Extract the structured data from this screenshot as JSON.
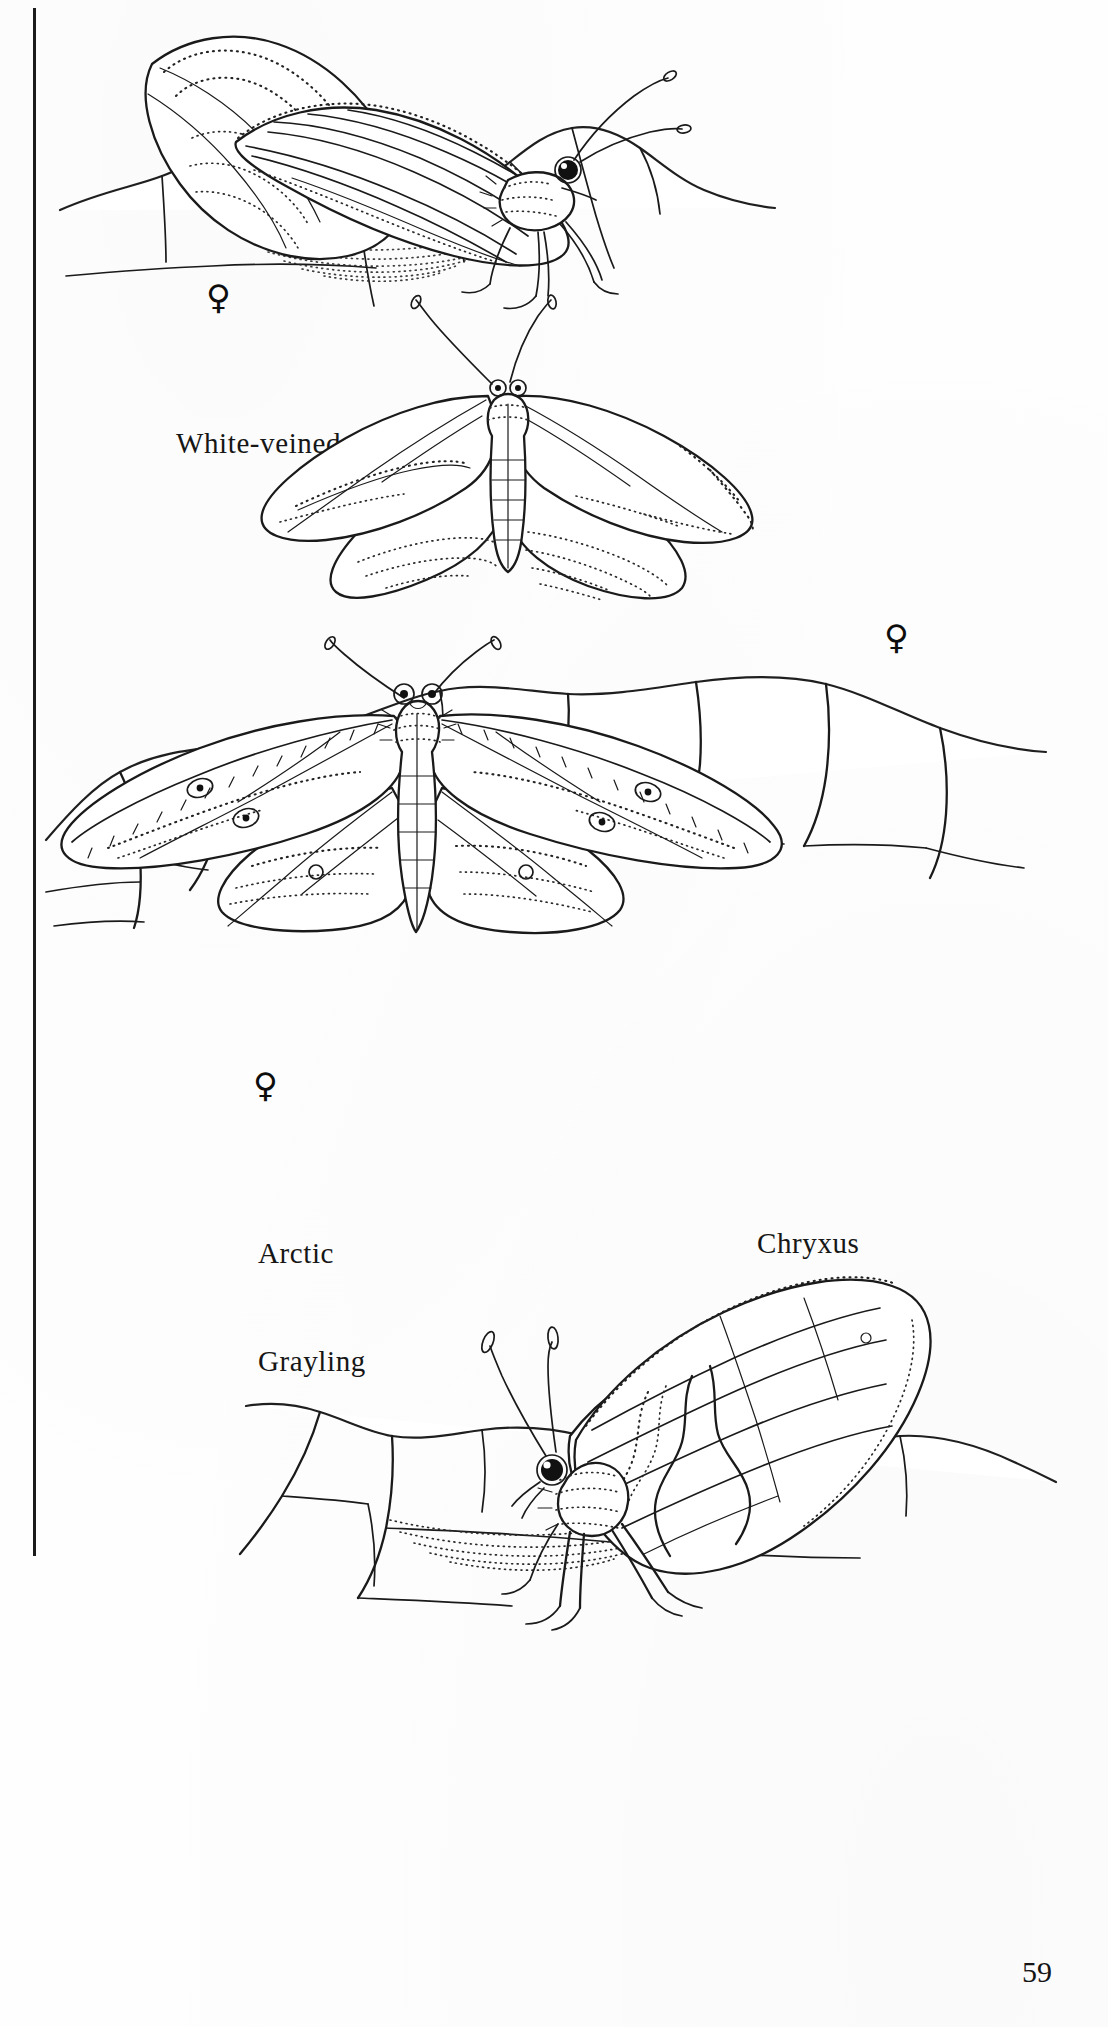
{
  "page": {
    "number": "59",
    "background_color": "#ffffff",
    "ink_color": "#1a1a1a",
    "margin_rule": "vertical-black-rule-left-edge"
  },
  "plates": [
    {
      "id": "white-veined-arctic-ventral",
      "common_name": "White-veined Arctic",
      "label_text": "White-veined  Arctic",
      "label_lines": [
        "White-veined  Arctic"
      ],
      "sex_symbol": "♀",
      "sex": "female",
      "view": "ventral, perched on rock, wings closed",
      "substrate": "rock"
    },
    {
      "id": "white-veined-arctic-dorsal",
      "common_name": "White-veined Arctic",
      "label_text": "",
      "label_lines": [],
      "sex_symbol": "♀",
      "sex": "female",
      "view": "dorsal, wings spread",
      "substrate": "none"
    },
    {
      "id": "chryxus-arctic",
      "common_name": "Chryxus Arctic",
      "label_text": "Chryxus Arctic",
      "label_lines": [
        "Chryxus",
        "Arctic"
      ],
      "sex_symbol": "♀",
      "sex": "female",
      "view": "dorsal, wings spread, perched on rock",
      "substrate": "rock"
    },
    {
      "id": "arctic-grayling",
      "common_name": "Arctic Grayling",
      "label_text": "Arctic Grayling",
      "label_lines": [
        "Arctic",
        "Grayling"
      ],
      "sex_symbol": "",
      "sex": "",
      "view": "ventral, perched on rock, wings closed",
      "substrate": "rock"
    }
  ],
  "icons": {
    "female": "♀"
  }
}
